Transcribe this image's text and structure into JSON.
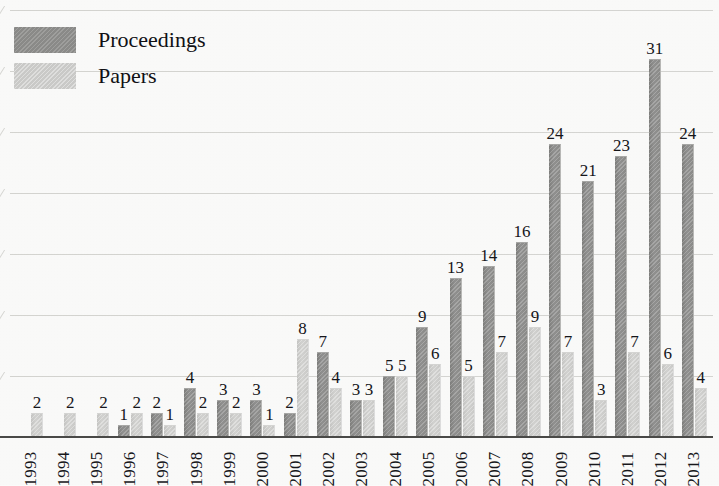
{
  "legend": {
    "position": "top-left",
    "entries": [
      {
        "label": "Proceedings",
        "color": "#8b8b89",
        "swatch": "proceedings"
      },
      {
        "label": "Papers",
        "color": "#cbcbc9",
        "swatch": "papers"
      }
    ]
  },
  "chart_data": {
    "type": "bar",
    "title": "",
    "subtitle": "",
    "xlabel": "",
    "ylabel": "",
    "ylim": [
      0,
      35
    ],
    "grid": true,
    "gridline_values": [
      35,
      30,
      25,
      20,
      15,
      10,
      5,
      0
    ],
    "legend_position": "top-left",
    "categories": [
      "1993",
      "1994",
      "1995",
      "1996",
      "1997",
      "1998",
      "1999",
      "2000",
      "2001",
      "2002",
      "2003",
      "2004",
      "2005",
      "2006",
      "2007",
      "2008",
      "2009",
      "2010",
      "2011",
      "2012",
      "2013"
    ],
    "series": [
      {
        "name": "Proceedings",
        "color": "#8b8b89",
        "values": [
          0,
          0,
          0,
          1,
          2,
          4,
          3,
          3,
          2,
          7,
          3,
          5,
          9,
          13,
          14,
          16,
          24,
          21,
          23,
          31,
          24
        ],
        "labels": [
          "",
          "",
          "",
          "1",
          "2",
          "4",
          "3",
          "3",
          "2",
          "7",
          "3",
          "5",
          "9",
          "13",
          "14",
          "16",
          "24",
          "21",
          "23",
          "31",
          "24"
        ]
      },
      {
        "name": "Papers",
        "color": "#cbcbc9",
        "values": [
          2,
          2,
          2,
          2,
          1,
          2,
          2,
          1,
          8,
          4,
          3,
          5,
          6,
          5,
          7,
          9,
          7,
          3,
          7,
          6,
          4
        ],
        "labels": [
          "2",
          "2",
          "2",
          "2",
          "1",
          "2",
          "2",
          "1",
          "8",
          "4",
          "3",
          "5",
          "6",
          "5",
          "7",
          "9",
          "7",
          "3",
          "7",
          "6",
          "4"
        ]
      }
    ]
  }
}
